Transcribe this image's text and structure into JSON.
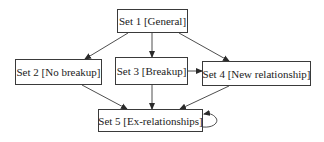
{
  "diagram": {
    "type": "directed-graph",
    "nodes": [
      {
        "id": "set1",
        "label": "Set 1 [General]"
      },
      {
        "id": "set2",
        "label": "Set 2 [No breakup]"
      },
      {
        "id": "set3",
        "label": "Set 3 [Breakup]"
      },
      {
        "id": "set4",
        "label": "Set 4 [New relationship]"
      },
      {
        "id": "set5",
        "label": "Set 5 [Ex-relationships]"
      }
    ],
    "edges": [
      {
        "from": "set1",
        "to": "set2"
      },
      {
        "from": "set1",
        "to": "set3"
      },
      {
        "from": "set1",
        "to": "set4"
      },
      {
        "from": "set3",
        "to": "set4"
      },
      {
        "from": "set2",
        "to": "set5"
      },
      {
        "from": "set3",
        "to": "set5"
      },
      {
        "from": "set4",
        "to": "set5"
      },
      {
        "from": "set5",
        "to": "set5"
      }
    ],
    "colors": {
      "stroke": "#3a3a3a",
      "text": "#222222",
      "background": "#ffffff"
    }
  }
}
